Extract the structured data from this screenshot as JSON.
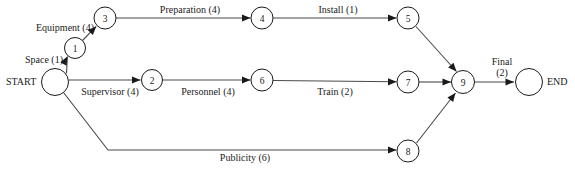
{
  "diagram": {
    "type": "network-diagram",
    "width": 575,
    "height": 172,
    "background_color": "#ffffff",
    "stroke_color": "#4a4a4a",
    "node_stroke_color": "#1a1a1a",
    "text_color": "#1a1a1a"
  },
  "terminals": {
    "start": {
      "label": "START",
      "cx": 55,
      "cy": 82,
      "r": 13.5,
      "label_x": 6,
      "label_y": 85
    },
    "end": {
      "label": "END",
      "cx": 529,
      "cy": 82,
      "r": 13.5,
      "label_x": 547,
      "label_y": 85
    }
  },
  "nodes": [
    {
      "id": "node-1",
      "label": "1",
      "cx": 75,
      "cy": 48,
      "r": 10.5
    },
    {
      "id": "node-2",
      "label": "2",
      "cx": 152,
      "cy": 80,
      "r": 10.5
    },
    {
      "id": "node-3",
      "label": "3",
      "cx": 105,
      "cy": 18,
      "r": 11
    },
    {
      "id": "node-4",
      "label": "4",
      "cx": 262,
      "cy": 18,
      "r": 11
    },
    {
      "id": "node-5",
      "label": "5",
      "cx": 408,
      "cy": 18,
      "r": 11
    },
    {
      "id": "node-6",
      "label": "6",
      "cx": 262,
      "cy": 80,
      "r": 11
    },
    {
      "id": "node-7",
      "label": "7",
      "cx": 408,
      "cy": 82,
      "r": 11
    },
    {
      "id": "node-8",
      "label": "8",
      "cx": 408,
      "cy": 151,
      "r": 11
    },
    {
      "id": "node-9",
      "label": "9",
      "cx": 463,
      "cy": 82,
      "r": 11.5
    }
  ],
  "edges": [
    {
      "id": "edge-space",
      "activity": "Space",
      "duration": "1",
      "label": "Space (1)",
      "from": "START",
      "to": "1",
      "label_x": 44,
      "label_y": 63,
      "path": "M 66.5 73.5 L 67.4 56.5",
      "arrow_x": 67.4,
      "arrow_y": 56.5,
      "arrow_angle": -62
    },
    {
      "id": "edge-equipment",
      "activity": "Equipment",
      "duration": "4",
      "label": "Equipment (4)",
      "from": "1",
      "to": "3",
      "label_x": 65,
      "label_y": 31,
      "path": "M 82.5 40.5 L 96.2 26.4",
      "arrow_x": 96.2,
      "arrow_y": 26.4,
      "arrow_angle": -46
    },
    {
      "id": "edge-preparation",
      "activity": "Preparation",
      "duration": "4",
      "label": "Preparation (4)",
      "from": "3",
      "to": "4",
      "label_x": 190,
      "label_y": 13,
      "path": "M 116 18 L 250.5 18",
      "arrow_x": 250.5,
      "arrow_y": 18,
      "arrow_angle": 0
    },
    {
      "id": "edge-install",
      "activity": "Install",
      "duration": "1",
      "label": "Install (1)",
      "from": "4",
      "to": "5",
      "label_x": 338,
      "label_y": 13,
      "path": "M 273 18 L 396.5 18",
      "arrow_x": 396.5,
      "arrow_y": 18,
      "arrow_angle": 0
    },
    {
      "id": "edge-supervisor",
      "activity": "Supervisor",
      "duration": "4",
      "label": "Supervisor (4)",
      "from": "START",
      "to": "2",
      "label_x": 110,
      "label_y": 95,
      "path": "M 68.5 80 L 140.5 80",
      "arrow_x": 140.5,
      "arrow_y": 80,
      "arrow_angle": 0
    },
    {
      "id": "edge-personnel",
      "activity": "Personnel",
      "duration": "4",
      "label": "Personnel (4)",
      "from": "2",
      "to": "6",
      "label_x": 208,
      "label_y": 95,
      "path": "M 162.5 80 L 250.5 80",
      "arrow_x": 250.5,
      "arrow_y": 80,
      "arrow_angle": 0
    },
    {
      "id": "edge-train",
      "activity": "Train",
      "duration": "2",
      "label": "Train (2)",
      "from": "6",
      "to": "7",
      "label_x": 335,
      "label_y": 95,
      "path": "M 273 80.5 L 396.5 81.8",
      "arrow_x": 396.5,
      "arrow_y": 81.8,
      "arrow_angle": 0
    },
    {
      "id": "edge-publicity",
      "activity": "Publicity",
      "duration": "6",
      "label": "Publicity (6)",
      "from": "START",
      "to": "8",
      "label_x": 245,
      "label_y": 161,
      "path": "M 63.5 92.5 L 108 150 L 396.5 150",
      "arrow_x": 396.5,
      "arrow_y": 150,
      "arrow_angle": 0
    },
    {
      "id": "edge-5-9",
      "activity": "",
      "duration": "",
      "label": "",
      "from": "5",
      "to": "9",
      "label_x": 0,
      "label_y": 0,
      "path": "M 416 26.5 L 456.5 71.5",
      "arrow_x": 456.5,
      "arrow_y": 71.5,
      "arrow_angle": 48
    },
    {
      "id": "edge-7-9",
      "activity": "",
      "duration": "",
      "label": "",
      "from": "7",
      "to": "9",
      "label_x": 0,
      "label_y": 0,
      "path": "M 419 82 L 451 82",
      "arrow_x": 451,
      "arrow_y": 82,
      "arrow_angle": 0
    },
    {
      "id": "edge-8-9",
      "activity": "",
      "duration": "",
      "label": "",
      "from": "8",
      "to": "9",
      "label_x": 0,
      "label_y": 0,
      "path": "M 416.5 143 L 455.5 93",
      "arrow_x": 455.5,
      "arrow_y": 93,
      "arrow_angle": -52
    },
    {
      "id": "edge-final",
      "activity": "Final",
      "duration": "2",
      "label": "Final (2)",
      "from": "9",
      "to": "END",
      "label_x": 502,
      "label_y": 65,
      "path": "M 474.5 82 L 514 82",
      "arrow_x": 514,
      "arrow_y": 82,
      "arrow_angle": 0
    }
  ],
  "multiline_labels": [
    {
      "id": "final-label",
      "line1": "Final",
      "line2": "(2)",
      "x": 502,
      "y": 65
    }
  ]
}
